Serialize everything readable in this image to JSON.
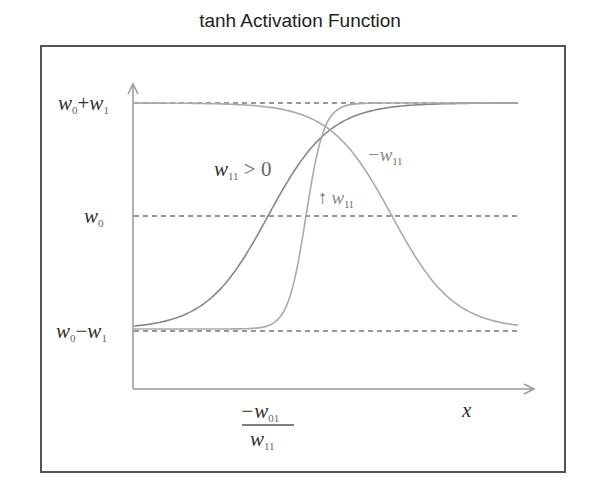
{
  "title": "tanh Activation Function",
  "y_axis": {
    "labels": {
      "top": "w₀+w₁",
      "mid": "w₀",
      "bottom": "w₀−w₁"
    },
    "label_parts": {
      "top": {
        "a": "w",
        "a_sub": "0",
        "op": "+",
        "b": "w",
        "b_sub": "1"
      },
      "mid": {
        "a": "w",
        "a_sub": "0"
      },
      "bottom": {
        "a": "w",
        "a_sub": "0",
        "op": "−",
        "b": "w",
        "b_sub": "1"
      }
    }
  },
  "x_axis": {
    "label": "x",
    "tick_label": {
      "numerator": "−w",
      "numerator_sub": "01",
      "denominator": "w",
      "denominator_sub": "11"
    }
  },
  "annotations": {
    "positive": {
      "var": "w",
      "sub": "11",
      "rest": " > 0"
    },
    "negative": {
      "prefix": "−w",
      "sub": "11"
    },
    "increase": {
      "arrow": "↑",
      "var": "w",
      "sub": "11"
    }
  },
  "colors": {
    "frame": "#555555",
    "axis": "#999999",
    "curve_moderate": "#888888",
    "curve_steep": "#aaaaaa",
    "curve_negative": "#aaaaaa",
    "dashed": "#777777",
    "text": "#333333"
  },
  "chart_data": {
    "type": "line",
    "title": "tanh Activation Function",
    "xlabel": "x",
    "ylabel": "",
    "x_tick_labels": [
      "-w01 / w11"
    ],
    "y_tick_labels": [
      "w0+w1",
      "w0",
      "w0-w1"
    ],
    "reference_lines": [
      {
        "name": "upper asymptote",
        "y": "w0+w1",
        "style": "dashed"
      },
      {
        "name": "midline",
        "y": "w0",
        "style": "dashed"
      },
      {
        "name": "lower asymptote",
        "y": "w0-w1",
        "style": "dashed"
      }
    ],
    "series": [
      {
        "name": "w11 > 0",
        "shape": "tanh rising, moderate slope",
        "from": "w0-w1",
        "to": "w0+w1"
      },
      {
        "name": "increasing w11",
        "shape": "tanh rising, steep slope",
        "from": "w0-w1",
        "to": "w0+w1"
      },
      {
        "name": "-w11",
        "shape": "tanh falling (mirror)",
        "from": "w0+w1",
        "to": "w0-w1"
      }
    ],
    "grid": false,
    "legend": "inline annotations"
  }
}
